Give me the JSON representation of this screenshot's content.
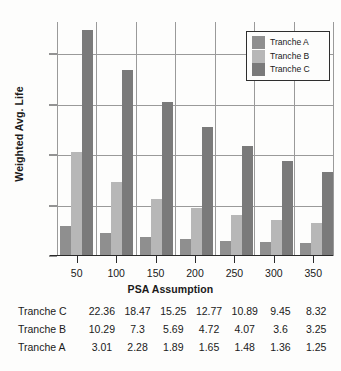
{
  "chart_data": {
    "type": "bar",
    "title": "",
    "xlabel": "PSA Assumption",
    "ylabel": "Weighted Avg. Life",
    "categories": [
      "50",
      "100",
      "150",
      "200",
      "250",
      "300",
      "350"
    ],
    "series": [
      {
        "name": "Tranche A",
        "color": "#8f8f8f",
        "values": [
          3.01,
          2.28,
          1.89,
          1.65,
          1.48,
          1.36,
          1.25
        ]
      },
      {
        "name": "Tranche B",
        "color": "#b7b7b7",
        "values": [
          10.29,
          7.3,
          5.69,
          4.72,
          4.07,
          3.6,
          3.25
        ]
      },
      {
        "name": "Tranche C",
        "color": "#7a7a7a",
        "values": [
          22.36,
          18.47,
          15.25,
          12.77,
          10.89,
          9.45,
          8.32
        ]
      }
    ],
    "ylim": [
      0,
      23.2
    ],
    "yticks": [
      0,
      5,
      10,
      15,
      20
    ],
    "ytick_labels": [
      "0",
      "5",
      "10",
      "15",
      "20"
    ],
    "grid": "both",
    "legend_position": "top-right",
    "legend_entries": [
      "Tranche A",
      "Tranche B",
      "Tranche C"
    ]
  },
  "axes": {
    "y_title": "Weighted Avg. Life",
    "x_title": "PSA Assumption"
  },
  "legend": {
    "items": [
      {
        "label": "Tranche A"
      },
      {
        "label": "Tranche B"
      },
      {
        "label": "Tranche C"
      }
    ]
  },
  "table": {
    "rows": [
      {
        "header": "Tranche C",
        "cells": [
          "22.36",
          "18.47",
          "15.25",
          "12.77",
          "10.89",
          "9.45",
          "8.32"
        ]
      },
      {
        "header": "Tranche B",
        "cells": [
          "10.29",
          "7.3",
          "5.69",
          "4.72",
          "4.07",
          "3.6",
          "3.25"
        ]
      },
      {
        "header": "Tranche A",
        "cells": [
          "3.01",
          "2.28",
          "1.89",
          "1.65",
          "1.48",
          "1.36",
          "1.25"
        ]
      }
    ]
  },
  "colors": {
    "tranche_a": "#8f8f8f",
    "tranche_b": "#b7b7b7",
    "tranche_c": "#7a7a7a",
    "grid": "#9a9a9a",
    "axis": "#2a2a2a",
    "background": "#fdfdfc"
  }
}
